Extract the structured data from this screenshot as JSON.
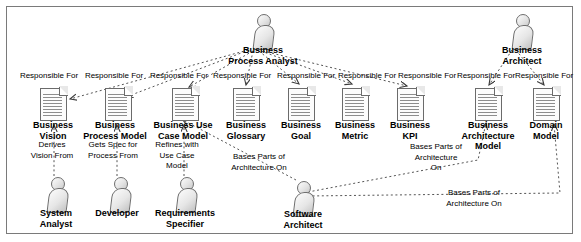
{
  "diagram": {
    "type": "uml-role-artifact-map",
    "background": "#ffffff",
    "border_color": "#7a7a7a",
    "line_style": "dotted",
    "line_color": "#555555"
  },
  "actors": [
    {
      "id": "business-process-analyst",
      "label": "Business\nProcess Analyst",
      "x": 250,
      "y": 14,
      "label_x": 208,
      "label_y": 45,
      "label_w": 110
    },
    {
      "id": "business-architect",
      "label": "Business\nArchitect",
      "x": 509,
      "y": 14,
      "label_x": 474,
      "label_y": 45,
      "label_w": 96
    },
    {
      "id": "system-analyst",
      "label": "System\nAnalyst",
      "x": 44,
      "y": 177,
      "label_x": 8,
      "label_y": 208,
      "label_w": 96
    },
    {
      "id": "developer",
      "label": "Developer",
      "x": 107,
      "y": 177,
      "label_x": 67,
      "label_y": 208,
      "label_w": 100
    },
    {
      "id": "requirements-specifier",
      "label": "Requirements\nSpecifier",
      "x": 173,
      "y": 177,
      "label_x": 125,
      "label_y": 208,
      "label_w": 120
    },
    {
      "id": "software-architect",
      "label": "Software\nArchitect",
      "x": 290,
      "y": 181,
      "label_x": 248,
      "label_y": 209,
      "label_w": 110
    }
  ],
  "artifacts": [
    {
      "id": "business-vision",
      "label": "Business\nVision",
      "x": 40,
      "y": 88,
      "label_x": 3,
      "label_y": 120,
      "label_w": 100
    },
    {
      "id": "business-process-model",
      "label": "Business\nProcess Model",
      "x": 105,
      "y": 88,
      "label_x": 55,
      "label_y": 120,
      "label_w": 120
    },
    {
      "id": "business-use-case-model",
      "label": "Business Use\nCase Model",
      "x": 172,
      "y": 88,
      "label_x": 123,
      "label_y": 120,
      "label_w": 120
    },
    {
      "id": "business-glossary",
      "label": "Business\nGlossary",
      "x": 233,
      "y": 88,
      "label_x": 194,
      "label_y": 120,
      "label_w": 104
    },
    {
      "id": "business-goal",
      "label": "Business\nGoal",
      "x": 288,
      "y": 88,
      "label_x": 252,
      "label_y": 120,
      "label_w": 98
    },
    {
      "id": "business-metric",
      "label": "Business\nMetric",
      "x": 342,
      "y": 88,
      "label_x": 305,
      "label_y": 120,
      "label_w": 100
    },
    {
      "id": "business-kpi",
      "label": "Business\nKPI",
      "x": 397,
      "y": 88,
      "label_x": 360,
      "label_y": 120,
      "label_w": 100
    },
    {
      "id": "business-architecture-model",
      "label": "Business\nArchitecture\nModel",
      "x": 475,
      "y": 88,
      "label_x": 434,
      "label_y": 120,
      "label_w": 108
    },
    {
      "id": "business-architecture-model-dup",
      "label": "Domain\nModel",
      "x": 533,
      "y": 88,
      "label_x": 500,
      "label_y": 120,
      "label_w": 92
    }
  ],
  "relations": [
    {
      "id": "rf-1",
      "label": "Responsible For",
      "x": 7,
      "y": 71,
      "w": 84
    },
    {
      "id": "rf-2",
      "label": "Responsible For",
      "x": 72,
      "y": 71,
      "w": 84
    },
    {
      "id": "rf-3",
      "label": "Responsible For",
      "x": 137,
      "y": 71,
      "w": 84
    },
    {
      "id": "rf-4",
      "label": "Responsible For",
      "x": 200,
      "y": 71,
      "w": 84
    },
    {
      "id": "rf-5",
      "label": "Responsible For",
      "x": 264,
      "y": 71,
      "w": 84
    },
    {
      "id": "rf-6",
      "label": "Responsible For",
      "x": 325,
      "y": 71,
      "w": 84
    },
    {
      "id": "rf-7",
      "label": "Responsible For",
      "x": 385,
      "y": 71,
      "w": 84
    },
    {
      "id": "rf-8",
      "label": "Responsible For",
      "x": 444,
      "y": 71,
      "w": 84
    },
    {
      "id": "rf-9",
      "label": "Responsible For",
      "x": 502,
      "y": 71,
      "w": 84
    },
    {
      "id": "derives-vision-from",
      "label": "Derives\nVision From",
      "x": 10,
      "y": 140,
      "w": 84
    },
    {
      "id": "gets-spec-for-process",
      "label": "Gets Spec for\nProcess From",
      "x": 70,
      "y": 140,
      "w": 86
    },
    {
      "id": "refines-with-use-case",
      "label": "Refines with\nUse Case\nModel",
      "x": 136,
      "y": 140,
      "w": 82
    },
    {
      "id": "bases-parts-1",
      "label": "Bases Parts of\nArchitecture On",
      "x": 213,
      "y": 152,
      "w": 92
    },
    {
      "id": "bases-parts-2",
      "label": "Bases Parts of\nArchitecture\nOn",
      "x": 392,
      "y": 142,
      "w": 88
    },
    {
      "id": "bases-parts-3",
      "label": "Bases Parts of\nArchitecture On",
      "x": 424,
      "y": 188,
      "w": 100
    }
  ]
}
